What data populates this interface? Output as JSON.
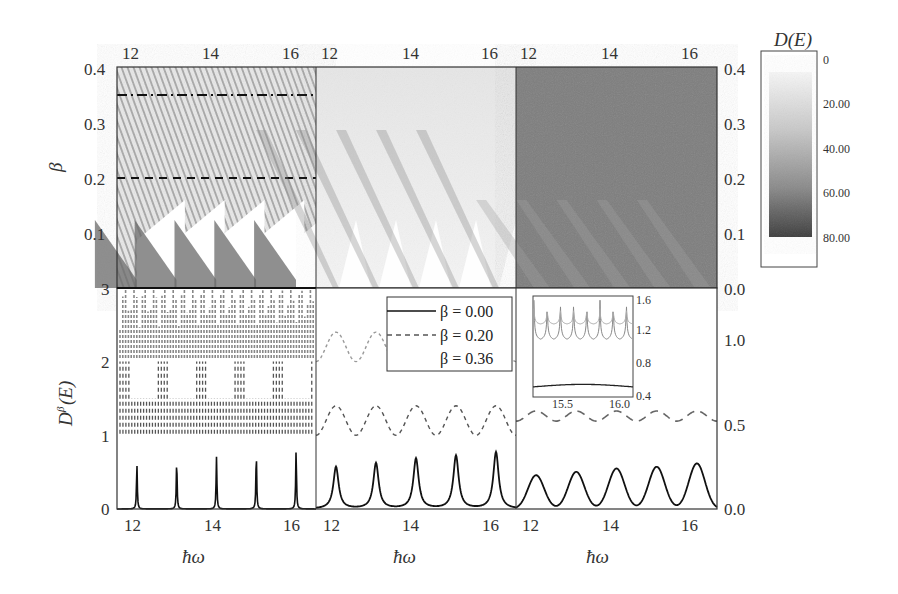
{
  "colorbar": {
    "title": "D(E)",
    "ticks": [
      "0",
      "20.00",
      "40.00",
      "60.00",
      "80.00"
    ],
    "range": [
      0,
      80
    ],
    "gradient": [
      "#f4f4f4",
      "#3a3a3a"
    ]
  },
  "axes": {
    "top_xticks": [
      "12",
      "14",
      "16"
    ],
    "bottom_xticks": [
      "12",
      "14",
      "16"
    ],
    "xlabel": "ħω",
    "top_left_ylabel": "β",
    "top_left_yticks": [
      "0.4",
      "0.3",
      "0.2",
      "0.1",
      "3"
    ],
    "top_right_yticks": [
      "0.4",
      "0.3",
      "0.2",
      "0.1",
      "0.0"
    ],
    "bottom_left_ylabel": "D^β(E)",
    "bottom_left_yticks": [
      "2",
      "1",
      "0"
    ],
    "bottom_right_yticks": [
      "1.0",
      "0.5",
      "0.0"
    ]
  },
  "legend": {
    "items": [
      {
        "label": "β = 0.00",
        "style": "solid"
      },
      {
        "label": "β = 0.20",
        "style": "dashed"
      },
      {
        "label": "β = 0.36",
        "style": "none"
      }
    ]
  },
  "inset": {
    "xticks": [
      "15.5",
      "16.0"
    ],
    "yticks": [
      "1.6",
      "1.2",
      "0.8",
      "0.4"
    ]
  },
  "chart_data": [
    {
      "type": "heatmap",
      "panel": "top-left",
      "title": "",
      "xlabel": "ħω",
      "ylabel": "β",
      "xlim": [
        11.5,
        16.5
      ],
      "ylim": [
        0.0,
        0.4
      ],
      "xticks": [
        12,
        14,
        16
      ],
      "yticks": [
        0.1,
        0.2,
        0.3,
        0.4
      ],
      "description": "Fine-structured D(E) map; sawtooth white wedges rising from each integer ħω at low β; dashed horizontal at β=0.20 and dash-dot at β=0.35",
      "reference_lines": [
        {
          "beta": 0.2,
          "style": "dashed"
        },
        {
          "beta": 0.35,
          "style": "dash-dot"
        }
      ]
    },
    {
      "type": "heatmap",
      "panel": "top-middle",
      "xlim": [
        11.5,
        16.5
      ],
      "ylim": [
        0.0,
        0.4
      ],
      "xticks": [
        12,
        14,
        16
      ],
      "description": "Smoother, light-gray D(E) map with diagonal dark streaks emerging from each integer ħω"
    },
    {
      "type": "heatmap",
      "panel": "top-right",
      "xlim": [
        11.5,
        16.5
      ],
      "ylim": [
        0.0,
        0.4
      ],
      "xticks": [
        12,
        14,
        16
      ],
      "yticks": [
        0.0,
        0.1,
        0.2,
        0.3,
        0.4
      ],
      "description": "Nearly uniform mid-dark gray D(E) map with faint diagonal streaks at low β"
    },
    {
      "type": "line",
      "panel": "bottom-left",
      "xlabel": "ħω",
      "ylabel": "D^β(E)",
      "xlim": [
        11.5,
        16.5
      ],
      "ylim": [
        0,
        3
      ],
      "x_peaks": [
        12,
        13,
        14,
        15,
        16
      ],
      "series": [
        {
          "name": "β = 0.00",
          "style": "solid",
          "peak_values": [
            0.61,
            0.66,
            0.71,
            0.76,
            0.8
          ],
          "baseline": 0
        },
        {
          "name": "β = 0.20",
          "style": "dashed",
          "band": [
            1.0,
            2.0
          ]
        },
        {
          "name": "β = 0.36",
          "style": "dotted-gray",
          "band": [
            2.0,
            2.9
          ]
        }
      ]
    },
    {
      "type": "line",
      "panel": "bottom-middle",
      "xlabel": "ħω",
      "xlim": [
        11.5,
        16.5
      ],
      "ylim": [
        0,
        3
      ],
      "x_peaks": [
        12,
        13,
        14,
        15,
        16
      ],
      "series": [
        {
          "name": "β = 0.00",
          "style": "solid",
          "peak_values": [
            0.57,
            0.62,
            0.68,
            0.72,
            0.77
          ],
          "baseline": 0
        },
        {
          "name": "β = 0.20",
          "style": "dashed",
          "oscillation": [
            1.0,
            1.4
          ]
        },
        {
          "name": "β = 0.36",
          "style": "dotted-gray",
          "oscillation": [
            2.0,
            2.4
          ]
        }
      ]
    },
    {
      "type": "line",
      "panel": "bottom-right",
      "xlabel": "ħω",
      "xlim": [
        11.5,
        16.5
      ],
      "ylim": [
        0.0,
        1.3
      ],
      "yticks": [
        0.0,
        0.5,
        1.0
      ],
      "x_peaks": [
        12,
        13,
        14,
        15,
        16
      ],
      "series": [
        {
          "name": "β = 0.00",
          "style": "solid",
          "peak_values": [
            0.2,
            0.22,
            0.24,
            0.25,
            0.27
          ],
          "baseline": 0
        },
        {
          "name": "β = 0.20",
          "style": "dashed",
          "oscillation": [
            0.52,
            0.58
          ]
        }
      ],
      "inset": {
        "xlim": [
          15.2,
          16.05
        ],
        "ylim": [
          0.4,
          1.6
        ],
        "xticks": [
          15.5,
          16.0
        ],
        "yticks": [
          0.4,
          0.8,
          1.2,
          1.6
        ],
        "series": [
          {
            "name": "lower",
            "style": "solid",
            "approx": 0.53
          },
          {
            "name": "upper",
            "style": "gray-peaks",
            "range": [
              1.05,
              1.6
            ]
          }
        ]
      }
    }
  ]
}
